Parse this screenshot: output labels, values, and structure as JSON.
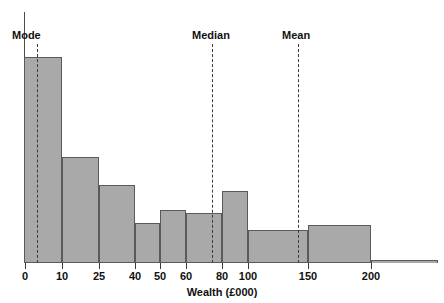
{
  "chart_data": {
    "type": "bar",
    "title": "",
    "subtitle": "",
    "xlabel": "Wealth (£000)",
    "ylabel": "",
    "grid": false,
    "legend_position": "none",
    "axis_note": "Ordinal (non-linear) x-axis: class boundaries are spaced at roughly equal pixel intervals regardless of numeric width.",
    "categories": [
      "0–10",
      "10–25",
      "25–40",
      "40–50",
      "50–60",
      "60–80",
      "80–100",
      "100–150",
      "150–200",
      "200+"
    ],
    "bin_edges": [
      0,
      10,
      25,
      40,
      50,
      60,
      80,
      100,
      150,
      200,
      250
    ],
    "tick_labels": [
      "0",
      "10",
      "25",
      "40",
      "50",
      "60",
      "80",
      "100",
      "150",
      "200"
    ],
    "tick_values": [
      0,
      10,
      25,
      40,
      50,
      60,
      80,
      100,
      150,
      200
    ],
    "values": [
      206,
      106,
      78,
      40,
      53,
      50,
      72,
      33,
      38,
      3
    ],
    "value_units": "relative bar height (pixels above baseline)",
    "ylim": [
      0,
      251
    ],
    "annotations": [
      {
        "label": "Mode",
        "at_value": 6,
        "style": "dashed-vertical"
      },
      {
        "label": "Median",
        "at_value": 88,
        "style": "dashed-vertical"
      },
      {
        "label": "Mean",
        "at_value": 146,
        "style": "dashed-vertical"
      }
    ],
    "colors": {
      "bar_fill": "#a9a9a9",
      "bar_stroke": "#5a5a5a",
      "axis": "#4a4a4a",
      "marker": "#3a3a3a",
      "text": "#111111",
      "background": "#ffffff"
    }
  },
  "layout": {
    "bars_px": [
      {
        "name": "0–10",
        "left": 24,
        "right": 62,
        "top": 57,
        "bottom": 263
      },
      {
        "name": "10–25",
        "right": 99,
        "left": 62,
        "top": 157,
        "bottom": 263
      },
      {
        "name": "25–40",
        "left": 99,
        "right": 135,
        "top": 185,
        "bottom": 263
      },
      {
        "name": "40–50",
        "left": 135,
        "right": 160,
        "top": 223,
        "bottom": 263
      },
      {
        "name": "50–60",
        "left": 160,
        "right": 186,
        "top": 210,
        "bottom": 263
      },
      {
        "name": "60–80",
        "left": 186,
        "right": 222,
        "top": 213,
        "bottom": 263
      },
      {
        "name": "80–100",
        "left": 222,
        "right": 248,
        "top": 191,
        "bottom": 263
      },
      {
        "name": "100–150",
        "left": 248,
        "right": 308,
        "top": 230,
        "bottom": 263
      },
      {
        "name": "150–200",
        "left": 308,
        "right": 371,
        "top": 225,
        "bottom": 263
      },
      {
        "name": "200+",
        "left": 371,
        "right": 438,
        "top": 260,
        "bottom": 263
      }
    ],
    "ticks_px": [
      {
        "label": "0",
        "x": 25
      },
      {
        "label": "10",
        "x": 62
      },
      {
        "label": "25",
        "x": 99
      },
      {
        "label": "40",
        "x": 135
      },
      {
        "label": "50",
        "x": 160
      },
      {
        "label": "60",
        "x": 186
      },
      {
        "label": "80",
        "x": 222
      },
      {
        "label": "100",
        "x": 248
      },
      {
        "label": "150",
        "x": 308
      },
      {
        "label": "200",
        "x": 371
      }
    ],
    "markers_px": [
      {
        "label": "Mode",
        "x": 37,
        "line_top": 44,
        "line_bottom": 263,
        "label_left": 12,
        "label_top": 29
      },
      {
        "label": "Median",
        "x": 212,
        "line_top": 44,
        "line_bottom": 263,
        "label_left": 192,
        "label_top": 29
      },
      {
        "label": "Mean",
        "x": 298,
        "line_top": 44,
        "line_bottom": 263,
        "label_left": 282,
        "label_top": 29
      }
    ]
  }
}
